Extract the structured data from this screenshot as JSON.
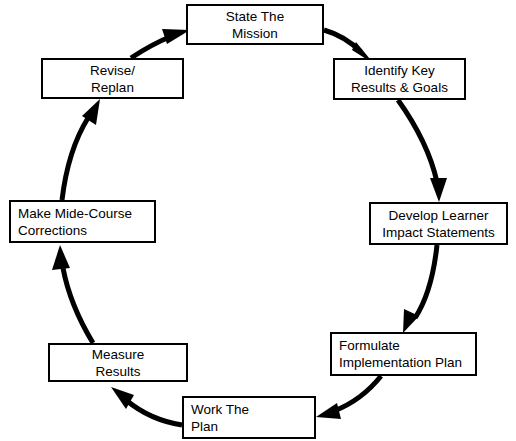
{
  "diagram": {
    "type": "cycle",
    "title": "",
    "direction": "clockwise",
    "background_color": "#ffffff",
    "line_color": "#000000",
    "box_border_color": "#000000",
    "box_fill_color": "#ffffff",
    "nodes": [
      {
        "id": "state-the-mission",
        "line1": "State The",
        "line2": "Mission",
        "align": "center",
        "x": 186,
        "y": 4,
        "w": 138,
        "h": 41
      },
      {
        "id": "identify-key-results-goals",
        "line1": "Identify Key",
        "line2": "Results & Goals",
        "align": "center",
        "x": 333,
        "y": 58,
        "w": 133,
        "h": 42
      },
      {
        "id": "develop-learner-impact-statements",
        "line1": "Develop Learner",
        "line2": "Impact Statements",
        "align": "center",
        "x": 369,
        "y": 202,
        "w": 139,
        "h": 43
      },
      {
        "id": "formulate-implementation-plan",
        "line1": "Formulate",
        "line2": "Implementation Plan",
        "align": "left",
        "x": 330,
        "y": 332,
        "w": 147,
        "h": 44
      },
      {
        "id": "work-the-plan",
        "line1": "Work The",
        "line2": "Plan",
        "align": "left",
        "x": 182,
        "y": 396,
        "w": 134,
        "h": 43
      },
      {
        "id": "measure-results",
        "line1": "Measure",
        "line2": "Results",
        "align": "center",
        "x": 48,
        "y": 343,
        "w": 140,
        "h": 39
      },
      {
        "id": "make-mide-course-corrections",
        "line1": "Make Mide-Course",
        "line2": "Corrections",
        "align": "left",
        "x": 9,
        "y": 200,
        "w": 147,
        "h": 43
      },
      {
        "id": "revise-replan",
        "line1": "Revise/",
        "line2": "Replan",
        "align": "center",
        "x": 41,
        "y": 58,
        "w": 143,
        "h": 41
      }
    ],
    "connections": [
      {
        "id": "mission-to-identify",
        "from": "state-the-mission",
        "to": "identify-key-results-goals"
      },
      {
        "id": "identify-to-develop",
        "from": "identify-key-results-goals",
        "to": "develop-learner-impact-statements"
      },
      {
        "id": "develop-to-formulate",
        "from": "develop-learner-impact-statements",
        "to": "formulate-implementation-plan"
      },
      {
        "id": "formulate-to-work",
        "from": "formulate-implementation-plan",
        "to": "work-the-plan"
      },
      {
        "id": "work-to-measure",
        "from": "work-the-plan",
        "to": "measure-results"
      },
      {
        "id": "measure-to-corrections",
        "from": "measure-results",
        "to": "make-mide-course-corrections"
      },
      {
        "id": "corrections-to-revise",
        "from": "make-mide-course-corrections",
        "to": "revise-replan"
      },
      {
        "id": "revise-to-mission",
        "from": "revise-replan",
        "to": "state-the-mission"
      }
    ]
  }
}
